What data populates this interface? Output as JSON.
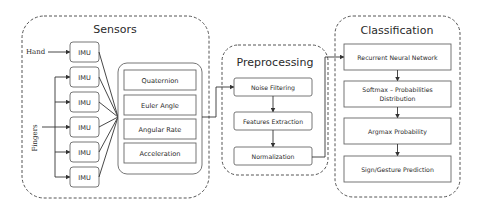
{
  "diagram": {
    "sensors": {
      "title": "Sensors",
      "inputs": {
        "hand": "Hand",
        "fingers": "Fingers"
      },
      "imu_units": [
        "IMU",
        "IMU",
        "IMU",
        "IMU",
        "IMU",
        "IMU"
      ],
      "outputs": [
        "Quaternion",
        "Euler Angle",
        "Angular Rate",
        "Acceleration"
      ]
    },
    "preprocessing": {
      "title": "Preprocessing",
      "steps": [
        "Noise Filtering",
        "Features Extraction",
        "Normalization"
      ]
    },
    "classification": {
      "title": "Classification",
      "steps": [
        {
          "line1": "Recurrent Neural Network",
          "line2": ""
        },
        {
          "line1": "Softmax – Probabilities",
          "line2": "Distribution"
        },
        {
          "line1": "Argmax Probability",
          "line2": ""
        },
        {
          "line1": "Sign/Gesture  Prediction",
          "line2": ""
        }
      ]
    },
    "colors": {
      "stroke": "#555555",
      "text": "#2a2a2a",
      "background": "#ffffff"
    }
  }
}
